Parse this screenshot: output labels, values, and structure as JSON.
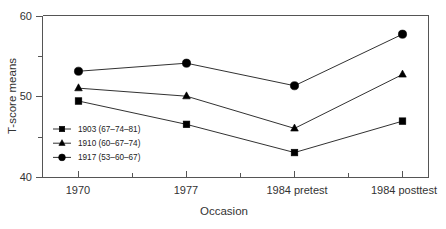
{
  "chart_data": {
    "type": "line",
    "title": "",
    "xlabel": "Occasion",
    "ylabel": "T-score means",
    "categories": [
      "1970",
      "1977",
      "1984 pretest",
      "1984 posttest"
    ],
    "ylim": [
      40,
      60
    ],
    "y_ticks": [
      40,
      50,
      60
    ],
    "y_minor_ticks": [
      45,
      55
    ],
    "grid": false,
    "legend_position": "inside-lower-left",
    "series": [
      {
        "name": "1903 (67–74–81)",
        "marker": "square",
        "values": [
          49.5,
          46.6,
          43.1,
          47.0
        ]
      },
      {
        "name": "1910 (60–67–74)",
        "marker": "triangle",
        "values": [
          51.1,
          50.1,
          46.1,
          52.8
        ]
      },
      {
        "name": "1917 (53–60–67)",
        "marker": "circle",
        "values": [
          53.2,
          54.2,
          51.4,
          57.8
        ]
      }
    ]
  },
  "axes": {
    "y_title": "T-score means",
    "x_title": "Occasion",
    "y_tick_labels": [
      "60",
      "50",
      "40"
    ],
    "x_tick_labels": [
      "1970",
      "1977",
      "1984 pretest",
      "1984 posttest"
    ]
  },
  "legend": {
    "items": [
      {
        "label": "1903 (67–74–81)",
        "marker": "square"
      },
      {
        "label": "1910 (60–67–74)",
        "marker": "triangle"
      },
      {
        "label": "1917 (53–60–67)",
        "marker": "circle"
      }
    ]
  }
}
